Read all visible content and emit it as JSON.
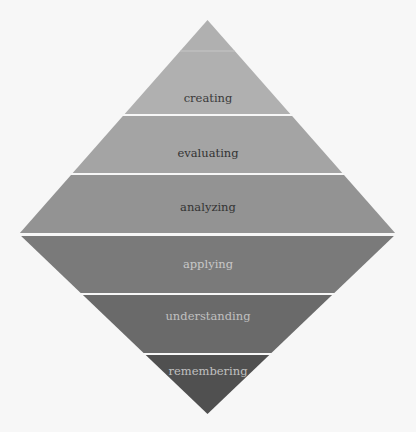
{
  "diagram": {
    "type": "pyramid-diamond",
    "title": "",
    "levels": [
      {
        "label": "creating",
        "fill": "#b0b0b0",
        "text_color": "#3a3a3a"
      },
      {
        "label": "evaluating",
        "fill": "#a4a4a4",
        "text_color": "#333333"
      },
      {
        "label": "analyzing",
        "fill": "#939393",
        "text_color": "#333333"
      },
      {
        "label": "applying",
        "fill": "#7a7a7a",
        "text_color": "#c8c8c8"
      },
      {
        "label": "understanding",
        "fill": "#6a6a6a",
        "text_color": "#c0c0c0"
      },
      {
        "label": "remembering",
        "fill": "#505050",
        "text_color": "#c0c0c0"
      }
    ],
    "background": "#f7f7f7",
    "separator_color": "#f7f7f7"
  }
}
